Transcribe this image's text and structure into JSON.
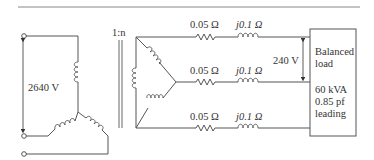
{
  "diagram": {
    "type": "circuit",
    "source": {
      "connection": "wye",
      "line_voltage_label": "2640 V"
    },
    "transformer": {
      "ratio_label": "1:n",
      "secondary_connection": "wye"
    },
    "lines": [
      {
        "resistance_label": "0.05 Ω",
        "reactance_label": "j0.1 Ω"
      },
      {
        "resistance_label": "0.05 Ω",
        "reactance_label": "j0.1 Ω"
      },
      {
        "resistance_label": "0.05 Ω",
        "reactance_label": "j0.1 Ω"
      }
    ],
    "load_voltage_label": "240 V",
    "load": {
      "title_line1": "Balanced",
      "title_line2": "load",
      "rating": "60 kVA",
      "pf": "0.85 pf",
      "pf_type": "leading"
    }
  }
}
